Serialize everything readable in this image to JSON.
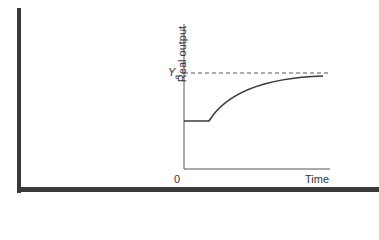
{
  "diagram": {
    "y_axis_label": "Real output",
    "x_axis_label": "Time",
    "origin_label": "0",
    "reference_line": {
      "label_main": "Y",
      "label_sub": "e",
      "style": "dashed"
    },
    "curve": "Output starts flat below Ye, then rises and asymptotically approaches Ye"
  },
  "colors": {
    "line": "#3a3a3a",
    "frame": "#3a3a3a",
    "text": "#333333"
  }
}
